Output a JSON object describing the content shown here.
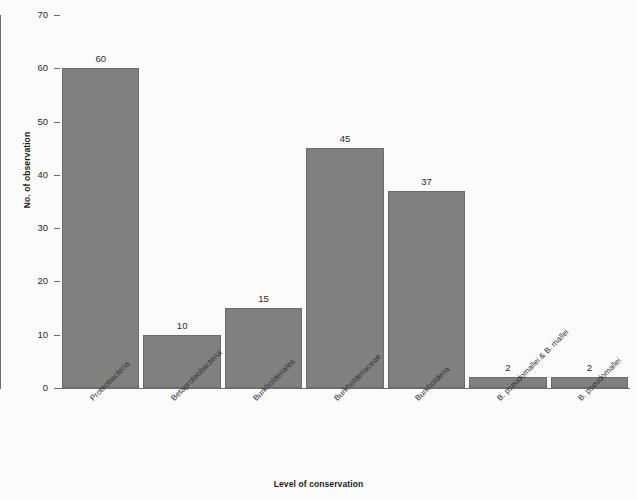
{
  "chart_data": {
    "type": "bar",
    "title": "",
    "xlabel": "Level of conservation",
    "ylabel": "No. of observation",
    "categories": [
      "Proteobacteria",
      "Betaproteobacteria",
      "Burkholderiales",
      "Burkholderiaceae",
      "Burkholderia",
      "B. pseudomallei & B. mallei",
      "B. pseudomallei"
    ],
    "values": [
      60,
      10,
      15,
      45,
      37,
      2,
      2
    ],
    "value_labels": [
      "60",
      "10",
      "15",
      "45",
      "37",
      "2",
      "2"
    ],
    "ylim": [
      0,
      70
    ],
    "yticks": [
      0,
      10,
      20,
      30,
      40,
      50,
      60,
      70
    ],
    "ytick_labels": [
      "0",
      "10",
      "20",
      "30",
      "40",
      "50",
      "60",
      "70"
    ],
    "grid": false,
    "legend": false,
    "bar_color": "#808080",
    "bar_edge_color": "#6b6b6b",
    "axis_color": "#6e6e6e",
    "background_color": "#fbfbfb",
    "label_rotation_deg": -45
  }
}
